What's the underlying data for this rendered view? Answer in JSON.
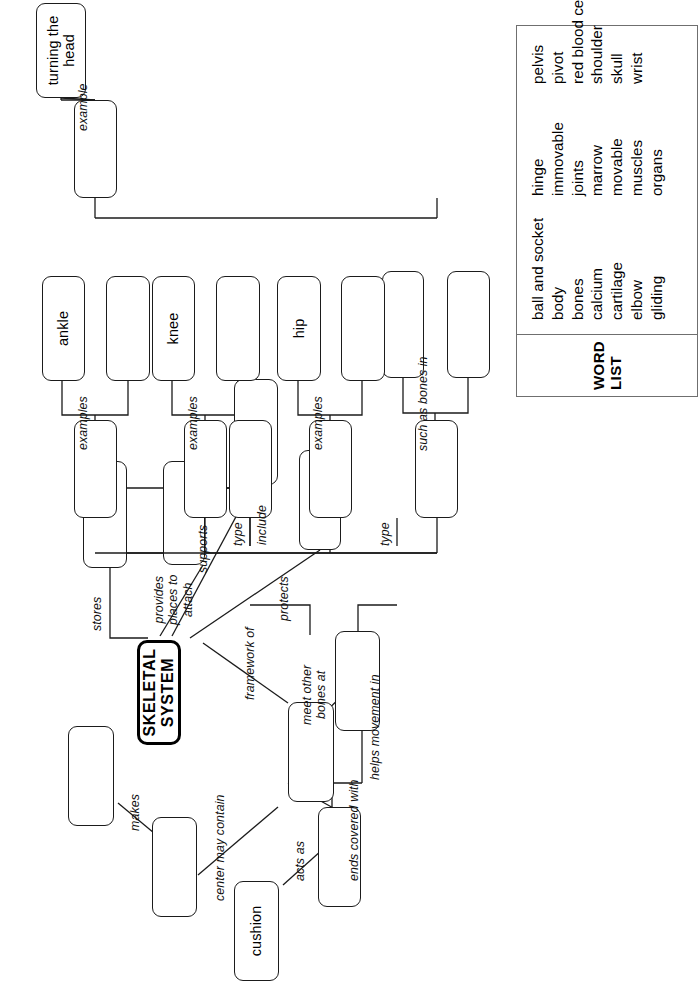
{
  "worksheet": {
    "central_node": "SKELETAL\nSYSTEM",
    "filled_nodes": {
      "cushion": "cushion",
      "hip": "hip",
      "knee": "knee",
      "ankle": "ankle",
      "turning_the_head": "turning the\nhead"
    },
    "connector_labels": {
      "stores": "stores",
      "provides_places_to_attach": "provides\nplaces to\nattach",
      "supports": "supports",
      "protects": "protects",
      "framework_of": "framework of",
      "meet_other_bones_at": "meet other\nbones at",
      "ends_covered_with": "ends covered with",
      "center_may_contain": "center may contain",
      "makes": "makes",
      "acts_as": "acts as",
      "helps_movement_in": "helps movement in",
      "type_upper": "type",
      "type_lower": "type",
      "such_as_bones_in": "such as bones in",
      "include": "include",
      "examples_1": "examples",
      "examples_2": "examples",
      "examples_3": "examples",
      "example_4": "example"
    },
    "blank_nodes": [
      "blank-stores-target",
      "blank-attach-target",
      "blank-supports-target",
      "blank-protects-target",
      "blank-bones",
      "blank-joints",
      "blank-cartilage",
      "blank-marrow",
      "blank-makes-target",
      "blank-type-upper",
      "blank-such-as-1",
      "blank-such-as-2",
      "blank-examples-1a",
      "blank-examples-1b",
      "blank-type-lower",
      "blank-include",
      "blank-examples-2",
      "blank-examples-2a",
      "blank-examples-2b",
      "blank-examples-3",
      "blank-examples-3a",
      "blank-examples-3b",
      "blank-example-4"
    ]
  },
  "word_list": {
    "title": "WORD LIST",
    "columns": [
      [
        "ball and socket",
        "body",
        "bones",
        "calcium",
        "cartilage",
        "elbow",
        "gliding"
      ],
      [
        "hinge",
        "immovable",
        "joints",
        "marrow",
        "movable",
        "muscles",
        "organs"
      ],
      [
        "pelvis",
        "pivot",
        "red blood cells",
        "shoulder",
        "skull",
        "wrist"
      ]
    ]
  },
  "colors": {
    "ink": "#1b1b1b",
    "paper": "#ffffff",
    "wordlist_border": "#6f6f6f"
  }
}
